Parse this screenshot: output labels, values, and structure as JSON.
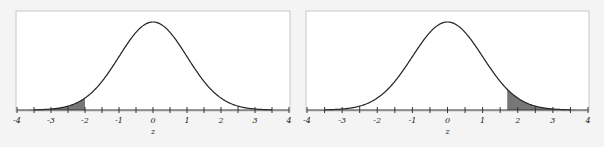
{
  "chart_data": [
    {
      "type": "area",
      "title": "",
      "xlabel": "z",
      "ylabel": "",
      "xlim": [
        -4,
        4
      ],
      "xticks": [
        "-4",
        "-3",
        "-2",
        "-1",
        "0",
        "1",
        "2",
        "3",
        "4"
      ],
      "curve": "standard normal density",
      "shaded_region": {
        "from": -4,
        "to": -2,
        "tail": "left"
      },
      "grid": false,
      "legend": null
    },
    {
      "type": "area",
      "title": "",
      "xlabel": "z",
      "ylabel": "",
      "xlim": [
        -4,
        4
      ],
      "xticks": [
        "-4",
        "-3",
        "-2",
        "-1",
        "0",
        "1",
        "2",
        "3",
        "4"
      ],
      "curve": "standard normal density",
      "shaded_region": {
        "from": 1.7,
        "to": 4,
        "tail": "right"
      },
      "grid": false,
      "legend": null
    }
  ],
  "colors": {
    "curve": "#222222",
    "shade": "#777777",
    "frame": "#c8c8c8",
    "axis": "#333333"
  }
}
